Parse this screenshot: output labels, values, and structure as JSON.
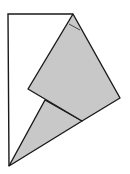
{
  "diagram": {
    "type": "folded-paper-figure",
    "colors": {
      "background": "#ffffff",
      "stroke": "#1a1a1a",
      "fill_folded": "#c8c8c8"
    },
    "outline_polygon": [
      [
        8,
        14
      ],
      [
        73,
        14
      ],
      [
        9,
        166
      ]
    ],
    "folded_quad": [
      [
        73,
        14
      ],
      [
        120,
        98
      ],
      [
        82,
        121
      ],
      [
        28,
        89
      ]
    ],
    "lower_triangle": [
      [
        45,
        100
      ],
      [
        82,
        121
      ],
      [
        9,
        166
      ]
    ],
    "crease_mark": [
      [
        69,
        24
      ],
      [
        80,
        30
      ]
    ]
  }
}
